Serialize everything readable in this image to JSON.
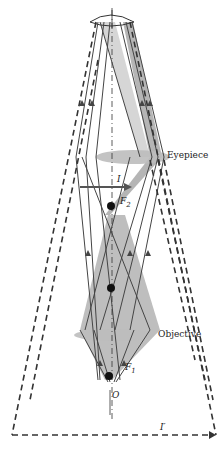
{
  "labels": {
    "eyepiece": "Eyepiece",
    "objective": "Objective",
    "image": "I",
    "final_image": "I′",
    "focal2": "F",
    "focal2_sub": "2",
    "focal1": "F",
    "focal1_sub": "1",
    "object": "O"
  },
  "colors": {
    "ray": "#444444",
    "shaded": "#a8a8a8",
    "lens": "#bdbdbd",
    "dashed": "#333333"
  }
}
